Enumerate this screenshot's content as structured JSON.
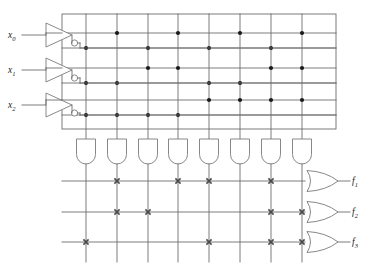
{
  "diagram": {
    "type": "programmable-logic-array",
    "colors": {
      "wire": "#6e6e6e",
      "gate_stroke": "#7a7a7a",
      "dot": "#1a1a1a",
      "cross": "#4a4a4a",
      "text": "#1a1a1a",
      "background": "#ffffff"
    }
  },
  "inputs": [
    {
      "id": "x0",
      "label": "x",
      "subscript": "0",
      "y": 35
    },
    {
      "id": "x1",
      "label": "x",
      "subscript": "1",
      "y": 70
    },
    {
      "id": "x2",
      "label": "x",
      "subscript": "2",
      "y": 105
    }
  ],
  "inverters": [
    {
      "id": "inv-x0",
      "input": "x0",
      "has_bubble": true
    },
    {
      "id": "inv-x1",
      "input": "x1",
      "has_bubble": true
    },
    {
      "id": "inv-x2",
      "input": "x2",
      "has_bubble": true
    }
  ],
  "and_plane": {
    "rows": [
      {
        "id": "row-x0",
        "signal": "x0",
        "y": 33
      },
      {
        "id": "row-x0n",
        "signal": "x0'",
        "y": 48
      },
      {
        "id": "row-x1",
        "signal": "x1",
        "y": 68
      },
      {
        "id": "row-x1n",
        "signal": "x1'",
        "y": 83
      },
      {
        "id": "row-x2",
        "signal": "x2",
        "y": 100
      },
      {
        "id": "row-x2n",
        "signal": "x2'",
        "y": 115
      }
    ],
    "columns": [
      {
        "id": "p1",
        "x": 86
      },
      {
        "id": "p2",
        "x": 117
      },
      {
        "id": "p3",
        "x": 148
      },
      {
        "id": "p4",
        "x": 178
      },
      {
        "id": "p5",
        "x": 209
      },
      {
        "id": "p6",
        "x": 240
      },
      {
        "id": "p7",
        "x": 271
      },
      {
        "id": "p8",
        "x": 302
      }
    ],
    "connections": [
      {
        "row": 0,
        "cols": [
          1,
          3,
          5,
          7
        ]
      },
      {
        "row": 1,
        "cols": [
          0,
          2,
          4,
          6
        ]
      },
      {
        "row": 2,
        "cols": [
          2,
          3,
          6,
          7
        ]
      },
      {
        "row": 3,
        "cols": [
          0,
          1,
          4,
          5
        ]
      },
      {
        "row": 4,
        "cols": [
          4,
          5,
          6,
          7
        ]
      },
      {
        "row": 5,
        "cols": [
          0,
          1,
          2,
          3
        ]
      }
    ]
  },
  "and_gates": [
    {
      "id": "and-1",
      "x": 86
    },
    {
      "id": "and-2",
      "x": 117
    },
    {
      "id": "and-3",
      "x": 148
    },
    {
      "id": "and-4",
      "x": 178
    },
    {
      "id": "and-5",
      "x": 209
    },
    {
      "id": "and-6",
      "x": 240
    },
    {
      "id": "and-7",
      "x": 271
    },
    {
      "id": "and-8",
      "x": 302
    }
  ],
  "or_plane": {
    "rows": [
      {
        "id": "or-row-f1",
        "y": 181
      },
      {
        "id": "or-row-f2",
        "y": 212
      },
      {
        "id": "or-row-f3",
        "y": 242
      }
    ],
    "connections": [
      {
        "row": 0,
        "cols": [
          1,
          3,
          4,
          6
        ]
      },
      {
        "row": 1,
        "cols": [
          1,
          2,
          6,
          7
        ]
      },
      {
        "row": 2,
        "cols": [
          0,
          4,
          6,
          7
        ]
      }
    ]
  },
  "or_gates": [
    {
      "id": "or-f1",
      "y": 181
    },
    {
      "id": "or-f2",
      "y": 212
    },
    {
      "id": "or-f3",
      "y": 242
    }
  ],
  "outputs": [
    {
      "id": "f1",
      "label": "f",
      "subscript": "1",
      "y": 181
    },
    {
      "id": "f2",
      "label": "f",
      "subscript": "2",
      "y": 212
    },
    {
      "id": "f3",
      "label": "f",
      "subscript": "3",
      "y": 242
    }
  ]
}
